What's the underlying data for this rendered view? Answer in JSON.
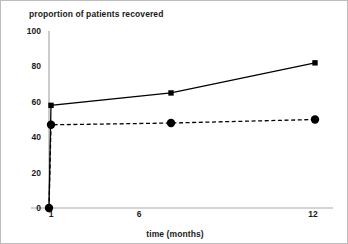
{
  "chart_data": {
    "type": "line",
    "title": "proportion of patients recovered",
    "xlabel": "time (months)",
    "ylabel": "",
    "x": [
      0,
      1,
      7,
      12
    ],
    "categories": [
      "0",
      "1",
      "7",
      "12"
    ],
    "xtick_labels": [
      "1",
      "6",
      "12"
    ],
    "xtick_values": [
      1,
      6,
      12
    ],
    "ytick_labels": [
      "0",
      "20",
      "40",
      "60",
      "80",
      "100"
    ],
    "ytick_values": [
      0,
      20,
      40,
      60,
      80,
      100
    ],
    "ylim": [
      0,
      100
    ],
    "grid": false,
    "legend": "none",
    "series": [
      {
        "name": "solid-line-series",
        "marker": "square",
        "linestyle": "solid",
        "color": "#000000",
        "values": [
          0,
          58,
          65,
          82
        ]
      },
      {
        "name": "dashed-line-series",
        "marker": "circle",
        "linestyle": "dashed",
        "color": "#000000",
        "values": [
          0,
          47,
          48,
          50
        ]
      }
    ]
  },
  "axes": {
    "axis_color": "#aaaaaa",
    "text_color": "#1a1a1a",
    "border_color": "#bdbdbd"
  }
}
